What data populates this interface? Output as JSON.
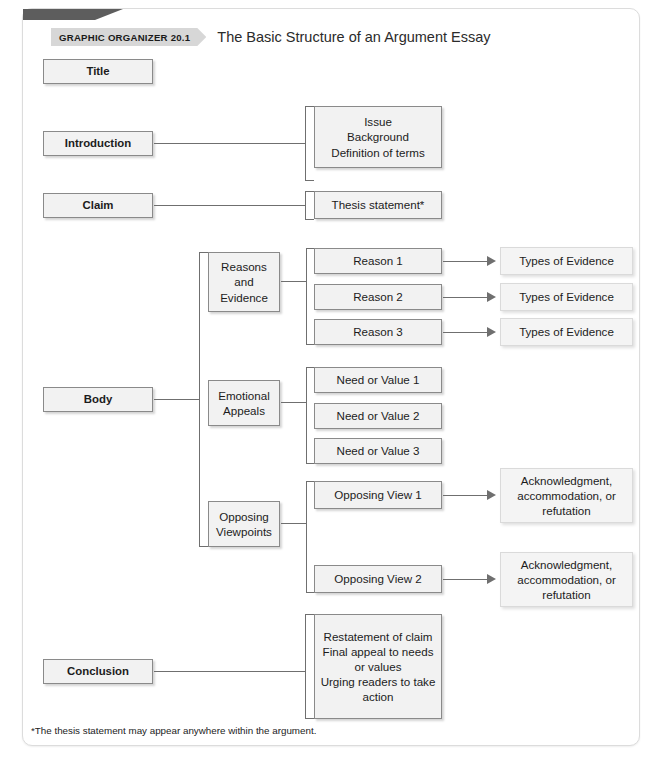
{
  "header": {
    "badge_label": "GRAPHIC ORGANIZER 20.1",
    "title": "The Basic Structure of an Argument Essay"
  },
  "stages": {
    "title": "Title",
    "introduction": "Introduction",
    "claim": "Claim",
    "body": "Body",
    "conclusion": "Conclusion"
  },
  "body_parts": {
    "reasons_and_evidence": "Reasons\nand\nEvidence",
    "emotional_appeals": "Emotional\nAppeals",
    "opposing_viewpoints": "Opposing\nViewpoints"
  },
  "details": {
    "introduction_detail": "Issue\nBackground\nDefinition of terms",
    "claim_detail": "Thesis statement*",
    "reason_1": "Reason 1",
    "reason_2": "Reason 2",
    "reason_3": "Reason 3",
    "need_or_value_1": "Need or Value 1",
    "need_or_value_2": "Need or Value 2",
    "need_or_value_3": "Need or Value 3",
    "opposing_view_1": "Opposing View 1",
    "opposing_view_2": "Opposing View 2",
    "conclusion_detail": "Restatement of claim\nFinal appeal to needs\nor values\nUrging readers to take\naction"
  },
  "evidence": {
    "types_of_evidence_1": "Types of Evidence",
    "types_of_evidence_2": "Types of Evidence",
    "types_of_evidence_3": "Types of Evidence",
    "response_1": "Acknowledgment,\naccommodation, or\nrefutation",
    "response_2": "Acknowledgment,\naccommodation, or\nrefutation"
  },
  "footnote": "*The thesis statement may appear anywhere within the argument.",
  "colors": {
    "box_fill": "#f2f2f2",
    "box_border": "#8a8a8a",
    "light_box_border": "#dadada",
    "connector": "#6f6f6f",
    "badge_bg": "#d7d7d7",
    "corner_tab": "#5d5d5d"
  }
}
